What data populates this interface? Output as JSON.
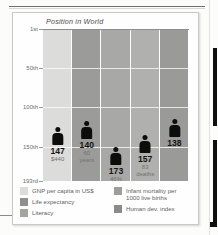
{
  "chart_data": {
    "type": "bar",
    "title": "Position in World",
    "xlabel": "",
    "ylabel": "",
    "ylim": [
      1,
      193
    ],
    "grid": true,
    "legend_position": "bottom",
    "yticks": [
      "1st",
      "50th",
      "100th",
      "150th",
      "193rd"
    ],
    "ytick_values": [
      1,
      50,
      100,
      150,
      193
    ],
    "categories": [
      "GNP per capita in US$",
      "Life expectancy",
      "Literacy",
      "Infant mortality per 1000 live births",
      "Human dev. index"
    ],
    "values": [
      147,
      140,
      173,
      157,
      138
    ],
    "rank_labels": [
      "147",
      "140",
      "173",
      "157",
      "138"
    ],
    "value_labels": [
      "$440",
      "60\nyears",
      "46%",
      "83\ndeaths",
      ""
    ],
    "column_colors": [
      "#dcdcda",
      "#9b9b99",
      "#a8a8a6",
      "#b0b0ae",
      "#9a9a98"
    ]
  },
  "chart": {
    "title": "Position in World",
    "axis": {
      "ticks": [
        {
          "label": "1st",
          "value": 1
        },
        {
          "label": "50th",
          "value": 50
        },
        {
          "label": "100th",
          "value": 100
        },
        {
          "label": "150th",
          "value": 150
        },
        {
          "label": "193rd",
          "value": 193
        }
      ]
    },
    "markers": [
      {
        "name": "gnp-per-capita",
        "rank": "147",
        "detail": "$440",
        "value": 147,
        "color": "#dcdcda"
      },
      {
        "name": "life-expectancy",
        "rank": "140",
        "detail": "60\nyears",
        "value": 140,
        "color": "#9b9b99"
      },
      {
        "name": "literacy",
        "rank": "173",
        "detail": "46%",
        "value": 173,
        "color": "#a8a8a6"
      },
      {
        "name": "infant-mortality",
        "rank": "157",
        "detail": "83\ndeaths",
        "value": 157,
        "color": "#b0b0ae"
      },
      {
        "name": "human-dev-index",
        "rank": "138",
        "detail": "",
        "value": 138,
        "color": "#9a9a98"
      }
    ]
  },
  "legend": {
    "left": [
      {
        "label": "GNP per capita in US$",
        "color": "#dcdcda"
      },
      {
        "label": "Life expectancy",
        "color": "#8f8f8d"
      },
      {
        "label": "Literacy",
        "color": "#a3a3a1"
      }
    ],
    "right": [
      {
        "label": "Infant mortality per\n1000 live births",
        "color": "#9d9d9b"
      },
      {
        "label": "Human dev. index",
        "color": "#8a8a88"
      }
    ]
  }
}
